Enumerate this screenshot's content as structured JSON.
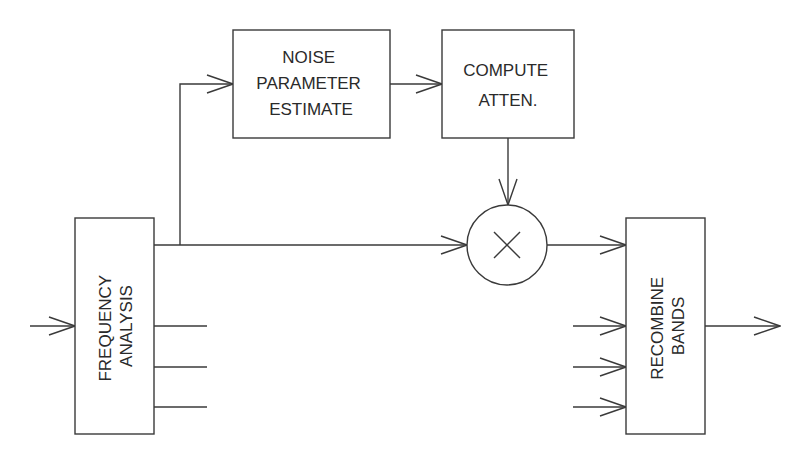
{
  "diagram": {
    "blocks": {
      "frequency_analysis": {
        "lines": [
          "FREQUENCY",
          "ANALYSIS"
        ]
      },
      "noise_parameter_estimate": {
        "lines": [
          "NOISE",
          "PARAMETER",
          "ESTIMATE"
        ]
      },
      "compute_atten": {
        "lines": [
          "COMPUTE",
          "ATTEN."
        ]
      },
      "multiplier": {
        "symbol": "×"
      },
      "recombine_bands": {
        "lines": [
          "RECOMBINE",
          "BANDS"
        ]
      }
    },
    "connections": [
      {
        "from": "input",
        "to": "frequency_analysis"
      },
      {
        "from": "frequency_analysis",
        "to": "noise_parameter_estimate"
      },
      {
        "from": "noise_parameter_estimate",
        "to": "compute_atten"
      },
      {
        "from": "compute_atten",
        "to": "multiplier"
      },
      {
        "from": "frequency_analysis",
        "to": "multiplier"
      },
      {
        "from": "multiplier",
        "to": "recombine_bands"
      },
      {
        "from": "frequency_analysis",
        "to": "recombine_bands",
        "count": 3
      },
      {
        "from": "recombine_bands",
        "to": "output"
      }
    ]
  }
}
